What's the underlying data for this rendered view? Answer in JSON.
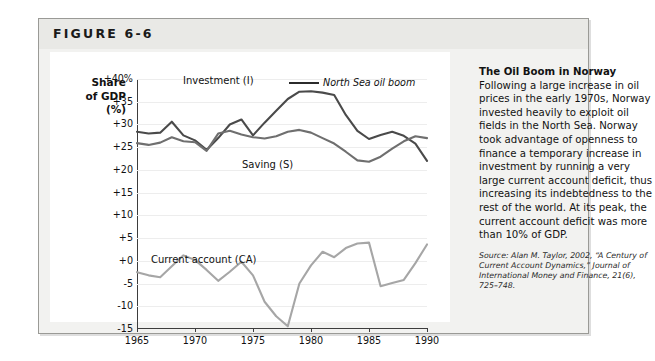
{
  "figure": {
    "label": "FIGURE 6-6"
  },
  "chart_data": {
    "type": "line",
    "title": "",
    "xlabel": "",
    "ylabel": "Share of GDP (%)",
    "ylabel_lines": [
      "Share",
      "of GDP",
      "(%)"
    ],
    "xlim": [
      1965,
      1990
    ],
    "ylim": [
      -15,
      40
    ],
    "grid": true,
    "legend_position": "inline-annotations",
    "ytick_labels": [
      "+40%",
      "+35",
      "+30",
      "+25",
      "+20",
      "+15",
      "+10",
      "+5",
      "+0",
      "-5",
      "-10",
      "-15"
    ],
    "ytick_values": [
      40,
      35,
      30,
      25,
      20,
      15,
      10,
      5,
      0,
      -5,
      -10,
      -15
    ],
    "xtick_labels": [
      "1965",
      "1970",
      "1975",
      "1980",
      "1985",
      "1990"
    ],
    "xtick_values": [
      1965,
      1970,
      1975,
      1980,
      1985,
      1990
    ],
    "x": [
      1965,
      1966,
      1967,
      1968,
      1969,
      1970,
      1971,
      1972,
      1973,
      1974,
      1975,
      1976,
      1977,
      1978,
      1979,
      1980,
      1981,
      1982,
      1983,
      1984,
      1985,
      1986,
      1987,
      1988,
      1989,
      1990
    ],
    "series": [
      {
        "name": "Investment (I)",
        "short": "I",
        "color": "#4a4a4a",
        "values": [
          28.4,
          28.0,
          28.2,
          30.6,
          27.6,
          26.5,
          24.4,
          27.0,
          30.0,
          31.1,
          27.6,
          30.4,
          33.0,
          35.6,
          37.2,
          37.3,
          37.0,
          36.5,
          32.1,
          28.6,
          26.8,
          27.7,
          28.4,
          27.5,
          25.8,
          22.0
        ]
      },
      {
        "name": "Saving (S)",
        "short": "S",
        "color": "#6f6f6f",
        "values": [
          25.9,
          25.5,
          26.0,
          27.2,
          26.3,
          26.1,
          24.2,
          28.0,
          28.6,
          27.8,
          27.2,
          26.9,
          27.4,
          28.4,
          28.8,
          28.2,
          27.0,
          25.8,
          24.0,
          22.1,
          21.8,
          22.9,
          24.7,
          26.3,
          27.4,
          27.0
        ]
      },
      {
        "name": "Current account (CA)",
        "short": "CA",
        "color": "#a6a6a6",
        "values": [
          -2.5,
          -3.2,
          -3.6,
          -1.2,
          1.2,
          0.2,
          -2.0,
          -4.4,
          -2.4,
          -0.2,
          -3.2,
          -9.0,
          -12.2,
          -14.4,
          -5.0,
          -1.0,
          2.0,
          0.8,
          2.8,
          3.8,
          4.0,
          -5.6,
          -4.9,
          -4.2,
          -0.5,
          3.6
        ]
      }
    ],
    "annotations": [
      {
        "text": "Investment (I)",
        "target": "investment-series"
      },
      {
        "text": "Saving (S)",
        "target": "saving-series"
      },
      {
        "text": "Current account (CA)",
        "target": "current-account-series"
      },
      {
        "text": "North Sea oil boom",
        "target": "investment-peak"
      }
    ]
  },
  "caption": {
    "title": "The Oil Boom in Norway",
    "body": " Following a large increase in oil prices in the early 1970s, Norway invested heavily to exploit oil fields in the North Sea. Norway took advantage of openness to finance a temporary increase in investment by running a very large current account deficit, thus increasing its indebtedness to the rest of the world. At its peak, the current account deficit was more than 10% of GDP.",
    "source_label": "Source:",
    "source_text": " Alan M. Taylor, 2002, “A Century of Current Account Dynamics,” Journal of International Money and Finance, 21(6), 725–748."
  },
  "colors": {
    "investment": "#4a4a4a",
    "saving": "#6f6f6f",
    "current_account": "#a6a6a6",
    "frame": "#9a9a96",
    "header_band": "#e9e9e6",
    "panel": "#f2f2f0"
  }
}
